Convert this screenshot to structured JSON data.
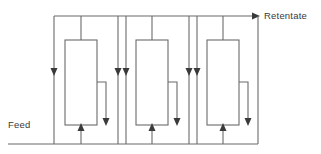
{
  "diagram": {
    "type": "process-flow",
    "canvas": {
      "width": 321,
      "height": 154
    },
    "style": {
      "line_color": "#6b6b6b",
      "arrow_color": "#3a3a3a",
      "text_color": "#3a3a3a",
      "background": "#ffffff",
      "line_width": 1.1
    },
    "labels": {
      "feed": "Feed",
      "retentate": "Retentate"
    },
    "label_positions": {
      "feed": {
        "x": 8,
        "y": 128
      },
      "retentate": {
        "x": 264,
        "y": 19
      }
    },
    "geometry": {
      "top_rail_y": 16,
      "bottom_rail_y": 144,
      "module_top_y": 40,
      "module_bottom_y": 125,
      "module_width": 32,
      "permeate_tap_y": 82,
      "permeate_arrow_y": 124,
      "feed_inlet_arrow_y": 73,
      "retentate_arrow_x": 258
    },
    "stages": [
      {
        "id": "stage-1",
        "name": "membrane-module-1",
        "recycle_riser_x": 54,
        "module_left_x": 65,
        "module_right_x": 97,
        "module_center_x": 81,
        "permeate_drop_x": 106,
        "feed_tie_in_x": 54,
        "bottom_return_x": 118
      },
      {
        "id": "stage-2",
        "name": "membrane-module-2",
        "recycle_riser_x": 126,
        "module_left_x": 136,
        "module_right_x": 168,
        "module_center_x": 152,
        "permeate_drop_x": 177,
        "feed_tie_in_x": 118,
        "bottom_return_x": 189
      },
      {
        "id": "stage-3",
        "name": "membrane-module-3",
        "recycle_riser_x": 197,
        "module_left_x": 207,
        "module_right_x": 239,
        "module_center_x": 223,
        "permeate_drop_x": 248,
        "feed_tie_in_x": 189,
        "bottom_return_x": 258
      }
    ],
    "streams": [
      {
        "id": "feed-stream",
        "label": "Feed",
        "direction": "right"
      },
      {
        "id": "retentate-stream",
        "label": "Retentate",
        "direction": "right"
      },
      {
        "id": "permeate-stream-1",
        "label": "",
        "direction": "down"
      },
      {
        "id": "permeate-stream-2",
        "label": "",
        "direction": "down"
      },
      {
        "id": "permeate-stream-3",
        "label": "",
        "direction": "down"
      }
    ]
  }
}
